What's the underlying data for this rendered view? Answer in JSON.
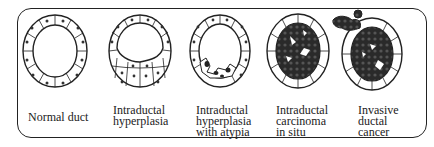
{
  "stages": [
    {
      "id": "normal",
      "label_lines": [
        "Normal duct"
      ],
      "cx": 55,
      "cy": 51
    },
    {
      "id": "ih",
      "label_lines": [
        "Intraductal",
        "hyperplasia"
      ],
      "cx": 140,
      "cy": 51
    },
    {
      "id": "iha",
      "label_lines": [
        "Intraductal",
        "hyperplasia",
        "with atypia"
      ],
      "cx": 220,
      "cy": 51
    },
    {
      "id": "dcis",
      "label_lines": [
        "Intraductal",
        "carcinoma",
        "in situ"
      ],
      "cx": 298,
      "cy": 51
    },
    {
      "id": "idc",
      "label_lines": [
        "Invasive",
        "ductal",
        "cancer"
      ],
      "cx": 372,
      "cy": 51
    }
  ],
  "colors": {
    "line": "#222222",
    "tumor": "#2a2a2a",
    "background": "#ffffff"
  }
}
